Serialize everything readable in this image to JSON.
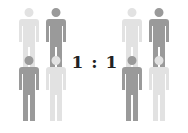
{
  "ratio": {
    "text": "1 : 1",
    "left": "1",
    "separator": ":",
    "right": "1"
  },
  "colors": {
    "light": "#e2e2e2",
    "dark": "#9a9a9a",
    "text": "#222222"
  },
  "groups": [
    {
      "name": "left",
      "figures": [
        {
          "shade": "light",
          "x": 17,
          "y": 8
        },
        {
          "shade": "dark",
          "x": 44,
          "y": 8
        },
        {
          "shade": "dark",
          "x": 17,
          "y": 56
        },
        {
          "shade": "light",
          "x": 44,
          "y": 56
        }
      ]
    },
    {
      "name": "right",
      "figures": [
        {
          "shade": "light",
          "x": 120,
          "y": 8
        },
        {
          "shade": "dark",
          "x": 147,
          "y": 8
        },
        {
          "shade": "dark",
          "x": 120,
          "y": 56
        },
        {
          "shade": "light",
          "x": 147,
          "y": 56
        }
      ]
    }
  ]
}
